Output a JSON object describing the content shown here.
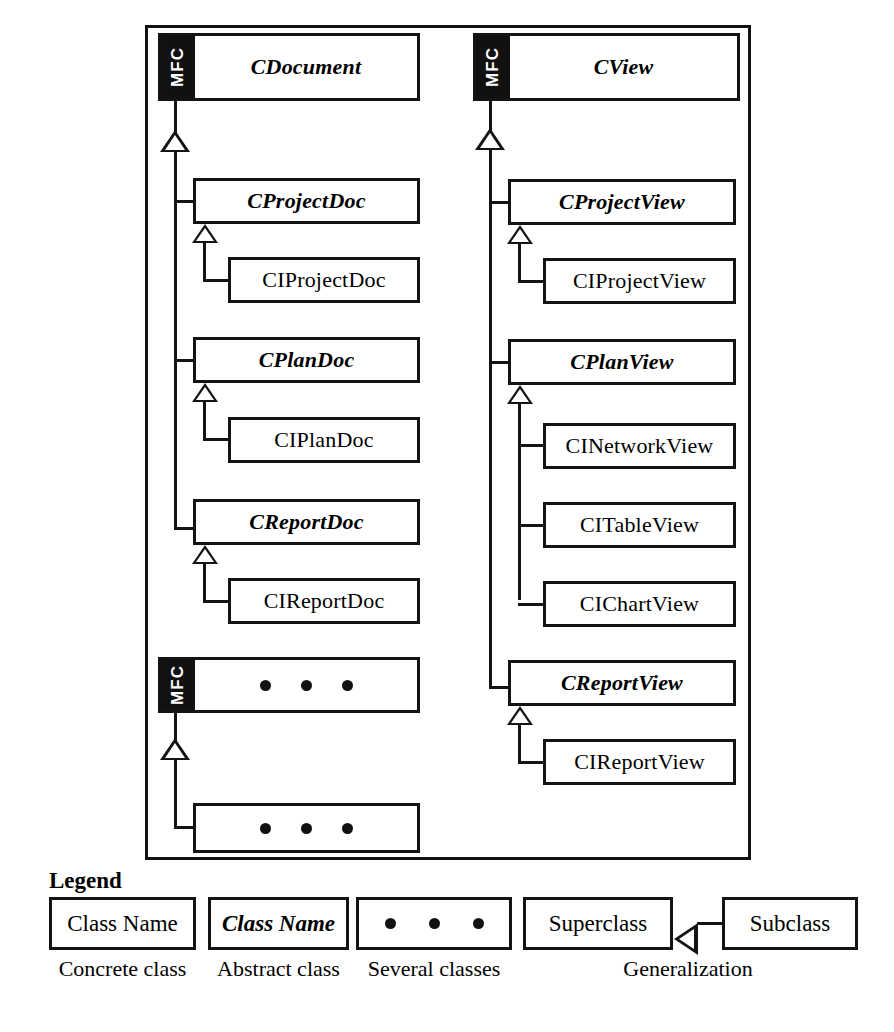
{
  "diagram": {
    "mfc_tab_label": "MFC",
    "document_branch": {
      "root": {
        "name": "CDocument",
        "kind": "abstract",
        "framework": "MFC"
      },
      "children": [
        {
          "name": "CProjectDoc",
          "kind": "abstract",
          "children": [
            {
              "name": "CIProjectDoc",
              "kind": "concrete"
            }
          ]
        },
        {
          "name": "CPlanDoc",
          "kind": "abstract",
          "children": [
            {
              "name": "CIPlanDoc",
              "kind": "concrete"
            }
          ]
        },
        {
          "name": "CReportDoc",
          "kind": "abstract",
          "children": [
            {
              "name": "CIReportDoc",
              "kind": "concrete"
            }
          ]
        }
      ]
    },
    "other_mfc_branch": {
      "root": {
        "name": "several-classes",
        "kind": "several",
        "framework": "MFC"
      },
      "children": [
        {
          "name": "several-classes",
          "kind": "several"
        }
      ]
    },
    "view_branch": {
      "root": {
        "name": "CView",
        "kind": "abstract",
        "framework": "MFC"
      },
      "children": [
        {
          "name": "CProjectView",
          "kind": "abstract",
          "children": [
            {
              "name": "CIProjectView",
              "kind": "concrete"
            }
          ]
        },
        {
          "name": "CPlanView",
          "kind": "abstract",
          "children": [
            {
              "name": "CINetworkView",
              "kind": "concrete"
            },
            {
              "name": "CITableView",
              "kind": "concrete"
            },
            {
              "name": "CIChartView",
              "kind": "concrete"
            }
          ]
        },
        {
          "name": "CReportView",
          "kind": "abstract",
          "children": [
            {
              "name": "CIReportView",
              "kind": "concrete"
            }
          ]
        }
      ]
    },
    "boxes": {
      "cdocument": "CDocument",
      "cprojectdoc": "CProjectDoc",
      "ciprojectdoc": "CIProjectDoc",
      "cplandoc": "CPlanDoc",
      "ciplandoc": "CIPlanDoc",
      "creportdoc": "CReportDoc",
      "cireportdoc": "CIReportDoc",
      "cview": "CView",
      "cprojectview": "CProjectView",
      "ciprojectview": "CIProjectView",
      "cplanview": "CPlanView",
      "cinetworkview": "CINetworkView",
      "citableview": "CITableView",
      "cichartview": "CIChartView",
      "creportview": "CReportView",
      "cireportview": "CIReportView"
    }
  },
  "legend": {
    "title": "Legend",
    "items": [
      {
        "box_label": "Class Name",
        "caption": "Concrete class",
        "style": "concrete"
      },
      {
        "box_label": "Class Name",
        "caption": "Abstract class",
        "style": "abstract"
      },
      {
        "box_label": "",
        "caption": "Several classes",
        "style": "several"
      },
      {
        "box_label": "Superclass",
        "second_box_label": "Subclass",
        "caption": "Generalization",
        "style": "generalization"
      }
    ],
    "superclass_label": "Superclass",
    "subclass_label": "Subclass",
    "generalization_caption": "Generalization"
  },
  "colors": {
    "ink": "#141414",
    "paper": "#ffffff",
    "mfc_tab_bg": "#111111",
    "mfc_tab_fg": "#ffffff"
  }
}
